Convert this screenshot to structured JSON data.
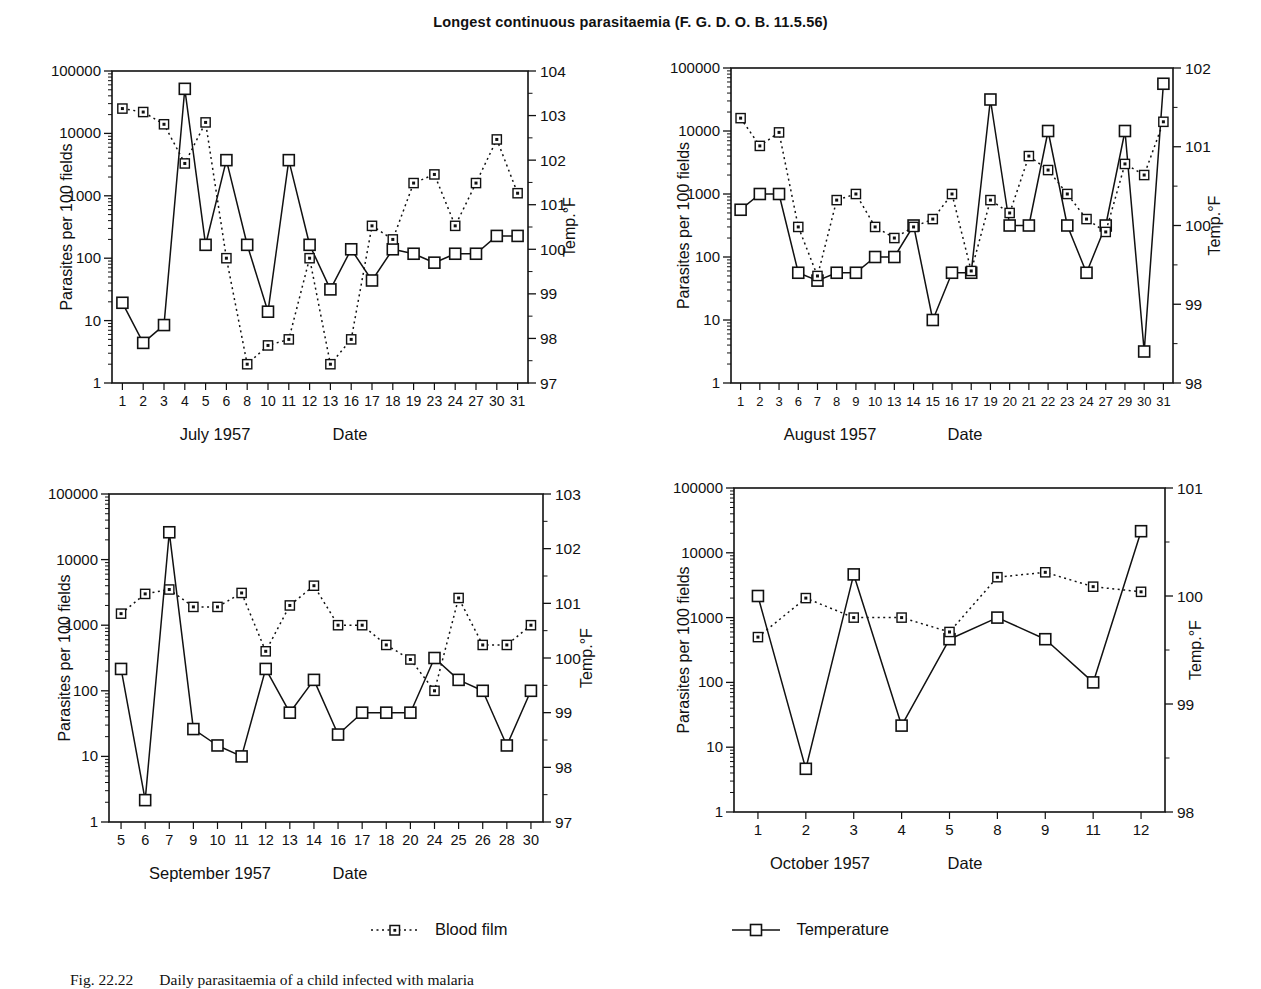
{
  "title": "Longest continuous parasitaemia (F. G. D. O. B. 11.5.56)",
  "legend": {
    "blood_film": "Blood film",
    "temperature": "Temperature"
  },
  "caption": {
    "fig_number": "Fig. 22.22",
    "text": "Daily parasitaemia of a child infected with malaria"
  },
  "colors": {
    "ink": "#111111",
    "background": "#ffffff"
  },
  "chart_data": [
    {
      "type": "line",
      "title": "July 1957",
      "xlabel": "Date",
      "ylabel_left": "Parasites per 100 fields",
      "ylabel_right": "Temp.°F",
      "y_left_log_range": [
        1,
        100000
      ],
      "y_left_ticks": [
        "100000",
        "10000",
        "1000",
        "100",
        "10",
        "1"
      ],
      "y_right_range": [
        97,
        104
      ],
      "y_right_ticks": [
        "104",
        "103",
        "102",
        "101",
        "100",
        "99",
        "98",
        "97"
      ],
      "grid": false,
      "categories": [
        "1",
        "2",
        "3",
        "4",
        "5",
        "6",
        "8",
        "10",
        "11",
        "12",
        "13",
        "16",
        "17",
        "18",
        "19",
        "23",
        "24",
        "27",
        "30",
        "31"
      ],
      "series": [
        {
          "name": "Blood film",
          "axis": "left",
          "style": "dashed",
          "values": [
            25000,
            22000,
            14000,
            3300,
            15000,
            100,
            2,
            4,
            5,
            100,
            2,
            5,
            330,
            200,
            1600,
            2200,
            330,
            1600,
            8000,
            1100
          ]
        },
        {
          "name": "Temperature",
          "axis": "right",
          "style": "solid",
          "values": [
            98.8,
            97.9,
            98.3,
            103.6,
            100.1,
            102.0,
            100.1,
            98.6,
            102.0,
            100.1,
            99.1,
            100.0,
            99.3,
            100.0,
            99.9,
            99.7,
            99.9,
            99.9,
            100.3,
            100.3
          ]
        }
      ]
    },
    {
      "type": "line",
      "title": "August 1957",
      "xlabel": "Date",
      "ylabel_left": "Parasites per 100 fields",
      "ylabel_right": "Temp.°F",
      "y_left_log_range": [
        1,
        100000
      ],
      "y_left_ticks": [
        "100000",
        "10000",
        "1000",
        "100",
        "10",
        "1"
      ],
      "y_right_range": [
        98,
        102
      ],
      "y_right_ticks": [
        "102",
        "101",
        "100",
        "99",
        "98"
      ],
      "grid": false,
      "categories": [
        "1",
        "2",
        "3",
        "6",
        "7",
        "8",
        "9",
        "10",
        "13",
        "14",
        "15",
        "16",
        "17",
        "19",
        "20",
        "21",
        "22",
        "23",
        "24",
        "27",
        "29",
        "30",
        "31"
      ],
      "series": [
        {
          "name": "Blood film",
          "axis": "left",
          "style": "dashed",
          "values": [
            16000,
            5800,
            9500,
            300,
            50,
            800,
            1000,
            300,
            200,
            300,
            400,
            1000,
            60,
            800,
            500,
            4000,
            2400,
            1000,
            400,
            250,
            3000,
            2000,
            14000
          ]
        },
        {
          "name": "Temperature",
          "axis": "right",
          "style": "solid",
          "values": [
            100.2,
            100.4,
            100.4,
            99.4,
            99.3,
            99.4,
            99.4,
            99.6,
            99.6,
            100.0,
            98.8,
            99.4,
            99.4,
            101.6,
            100.0,
            100.0,
            101.2,
            100.0,
            99.4,
            100.0,
            101.2,
            98.4,
            101.8
          ]
        }
      ]
    },
    {
      "type": "line",
      "title": "September 1957",
      "xlabel": "Date",
      "ylabel_left": "Parasites per 100 fields",
      "ylabel_right": "Temp.°F",
      "y_left_log_range": [
        1,
        100000
      ],
      "y_left_ticks": [
        "100000",
        "10000",
        "1000",
        "100",
        "10",
        "1"
      ],
      "y_right_range": [
        97,
        103
      ],
      "y_right_ticks": [
        "103",
        "102",
        "101",
        "100",
        "99",
        "98",
        "97"
      ],
      "grid": false,
      "categories": [
        "5",
        "6",
        "7",
        "9",
        "10",
        "11",
        "12",
        "13",
        "14",
        "16",
        "17",
        "18",
        "20",
        "24",
        "25",
        "26",
        "28",
        "30"
      ],
      "series": [
        {
          "name": "Blood film",
          "axis": "left",
          "style": "dashed",
          "values": [
            1500,
            3000,
            3500,
            1900,
            1900,
            3100,
            400,
            2000,
            4000,
            1000,
            1000,
            500,
            300,
            100,
            2600,
            500,
            500,
            1000
          ]
        },
        {
          "name": "Temperature",
          "axis": "right",
          "style": "solid",
          "values": [
            99.8,
            97.4,
            102.3,
            98.7,
            98.4,
            98.2,
            99.8,
            99.0,
            99.6,
            98.6,
            99.0,
            99.0,
            99.0,
            100.0,
            99.6,
            99.4,
            98.4,
            99.4
          ]
        }
      ]
    },
    {
      "type": "line",
      "title": "October 1957",
      "xlabel": "Date",
      "ylabel_left": "Parasites per 100 fields",
      "ylabel_right": "Temp.°F",
      "y_left_log_range": [
        1,
        100000
      ],
      "y_left_ticks": [
        "100000",
        "10000",
        "1000",
        "100",
        "10",
        "1"
      ],
      "y_right_range": [
        98,
        101
      ],
      "y_right_ticks": [
        "101",
        "100",
        "99",
        "98"
      ],
      "grid": false,
      "categories": [
        "1",
        "2",
        "3",
        "4",
        "5",
        "8",
        "9",
        "11",
        "12"
      ],
      "series": [
        {
          "name": "Blood film",
          "axis": "left",
          "style": "dashed",
          "values": [
            500,
            2000,
            1000,
            1000,
            600,
            4200,
            5000,
            3000,
            2500
          ]
        },
        {
          "name": "Temperature",
          "axis": "right",
          "style": "solid",
          "values": [
            100.0,
            98.4,
            100.2,
            98.8,
            99.6,
            99.8,
            99.6,
            99.2,
            100.6
          ]
        }
      ]
    }
  ]
}
